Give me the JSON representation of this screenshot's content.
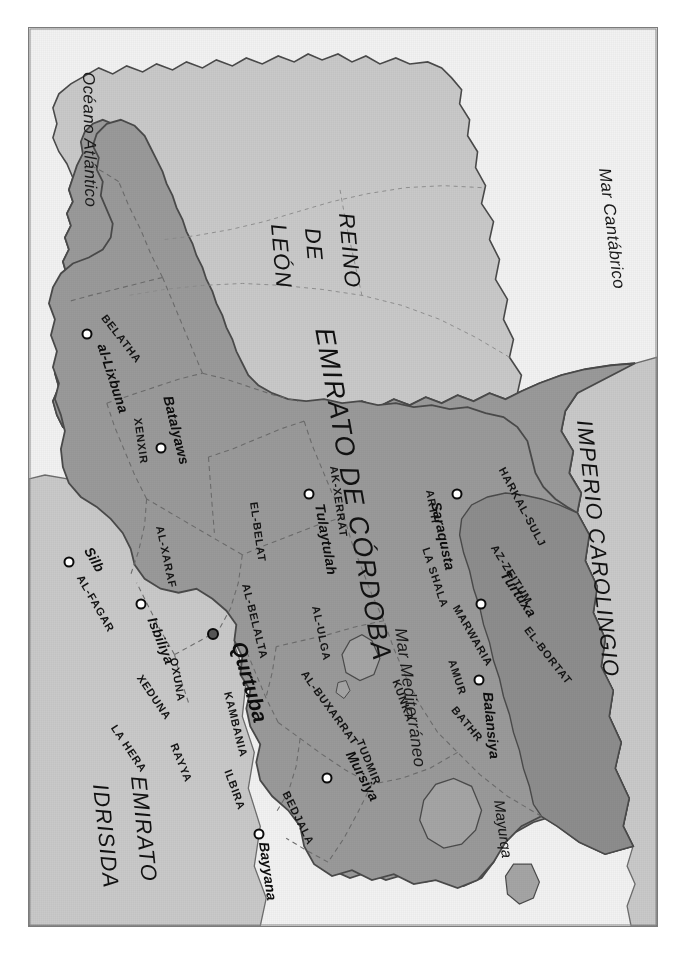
{
  "map": {
    "title": "Emirato de Córdoba",
    "rotation_note": "90",
    "colors": {
      "sea": "#f2f2f2",
      "land_neighbour": "#c9c9c9",
      "emirate": "#9a9a9a",
      "emirate_north": "#8d8d8d",
      "island": "#a5a5a5",
      "border": "#6d6d6d",
      "frame": "#7b7b7b",
      "text": "#111111"
    },
    "seas": [
      {
        "name": "Mar Cantábrico"
      },
      {
        "name": "Océano Atlántico"
      },
      {
        "name": "Mar Mediterráneo"
      }
    ],
    "realms": [
      {
        "name": "IMPERIO CAROLINGIO"
      },
      {
        "name": "REINO DE LEÓN",
        "lines": [
          "REINO",
          "DE",
          "LEÓN"
        ]
      },
      {
        "name": "EMIRATO IDRISIDA",
        "lines": [
          "EMIRATO",
          "IDRISIDA"
        ]
      },
      {
        "name": "EMIRATO DE CÓRDOBA"
      }
    ],
    "islands": [
      {
        "name": "Mayurqa"
      }
    ],
    "provinces": [
      {
        "name": "EL-BORTAT"
      },
      {
        "name": "AZ-ZEITUM"
      },
      {
        "name": "HARKAL-SULJ"
      },
      {
        "name": "ARTH"
      },
      {
        "name": "LA SHALA"
      },
      {
        "name": "MARWARIA"
      },
      {
        "name": "AMUR"
      },
      {
        "name": "BATHR"
      },
      {
        "name": "KUNKA"
      },
      {
        "name": "TUDMIR"
      },
      {
        "name": "BEDJALA"
      },
      {
        "name": "ILBIRA"
      },
      {
        "name": "AK-XERRAT"
      },
      {
        "name": "AL-ULGA"
      },
      {
        "name": "AL-BUXARRAT"
      },
      {
        "name": "EL-BELAT"
      },
      {
        "name": "AL-BELALTA"
      },
      {
        "name": "KAMBANIA"
      },
      {
        "name": "RAYYA"
      },
      {
        "name": "OXUNA"
      },
      {
        "name": "XEDUNA"
      },
      {
        "name": "LA HERA"
      },
      {
        "name": "AL-XARAF"
      },
      {
        "name": "XENXIR"
      },
      {
        "name": "AL-FAGAR"
      },
      {
        "name": "BELATHA"
      }
    ],
    "cities": [
      {
        "name": "Turtuxa",
        "capital": false
      },
      {
        "name": "Saraqusta",
        "capital": false
      },
      {
        "name": "Balansiya",
        "capital": false
      },
      {
        "name": "Mursiya",
        "capital": false
      },
      {
        "name": "Bayyana",
        "capital": false
      },
      {
        "name": "Tulaytulah",
        "capital": false
      },
      {
        "name": "Qurtuba",
        "capital": true
      },
      {
        "name": "Isbiliya",
        "capital": false
      },
      {
        "name": "Batalyaws",
        "capital": false
      },
      {
        "name": "al-Lixbuna",
        "capital": false
      },
      {
        "name": "Silb",
        "capital": false
      }
    ]
  }
}
